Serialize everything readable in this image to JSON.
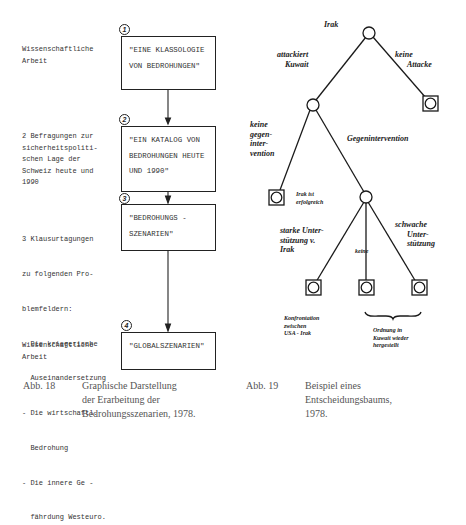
{
  "figure_18": {
    "left_labels": [
      {
        "lines": [
          "Wissenschaftliche",
          "Arbeit"
        ]
      },
      {
        "lines": [
          "2 Befragungen zur",
          "sicherheitspoliti-",
          "schen Lage der",
          "Schweiz heute und",
          "1990"
        ]
      },
      {
        "lines": [
          "3 Klausurtagungen",
          "zu folgenden Pro-",
          "blemfeldern:",
          "- Die kriegerische",
          "  Auseinandersetzung",
          "- Die wirtschaftl.",
          "  Bedrohung",
          "- Die innere Ge -",
          "  fährdung Westeuro."
        ]
      },
      {
        "lines": [
          "Wissenschaftliche",
          "Arbeit"
        ]
      }
    ],
    "steps": [
      {
        "number": "1",
        "lines": [
          "\"EINE KLASSOLOGIE",
          "VON BEDROHUNGEN\""
        ]
      },
      {
        "number": "2",
        "lines": [
          "\"EIN KATALOG VON",
          "BEDROHUNGEN HEUTE",
          "UND 1990\""
        ]
      },
      {
        "number": "3",
        "lines": [
          "\"BEDROHUNGS -",
          "SZENARIEN\""
        ]
      },
      {
        "number": "4",
        "lines": [
          "\"GLOBALSZENARIEN\""
        ]
      }
    ],
    "caption": {
      "label": "Abb. 18",
      "lines": [
        "Graphische Darstellung",
        "der Erarbeitung der",
        "Bedrohungsszenarien, 1978."
      ]
    }
  },
  "figure_19": {
    "nodes": {
      "root": {
        "label": "Irak"
      },
      "n_attack": {
        "label": "attackiert Kuwait"
      },
      "leaf_no_attack": {
        "label": "keine Attacke"
      },
      "leaf_no_counter": {
        "label": "keine gegen-intervention",
        "outcome": "Irak ist erfolgreich"
      },
      "n_counter": {
        "label": "Gegenintervention"
      },
      "leaf_strong": {
        "label": "starke Unterstützung v. Irak",
        "outcome": "Konfrontation zwischen USA - Irak"
      },
      "leaf_none": {
        "label": "keine"
      },
      "leaf_weak": {
        "label": "schwache Unterstützung"
      }
    },
    "brace_note": [
      "Ordnung in",
      "Kuwait wieder",
      "hergestellt"
    ],
    "texts": {
      "irak": "Irak",
      "attack_l1": "attackiert",
      "attack_l2": "Kuwait",
      "noattack_l1": "keine",
      "noattack_l2": "Attacke",
      "nocounter": [
        "keine",
        "gegen-",
        "inter-",
        "vention"
      ],
      "counter": "Gegenintervention",
      "success": [
        "Irak ist",
        "erfolgreich"
      ],
      "strong": [
        "starke Unter-",
        "stützung v.",
        "Irak"
      ],
      "none": "keine",
      "weak": [
        "schwache",
        "Unter-",
        "stützung"
      ],
      "confront": [
        "Konfrontation",
        "zwischen",
        "USA - Irak"
      ]
    },
    "caption": {
      "label": "Abb. 19",
      "lines": [
        "Beispiel eines",
        "Entscheidungsbaums,",
        "1978."
      ]
    }
  }
}
